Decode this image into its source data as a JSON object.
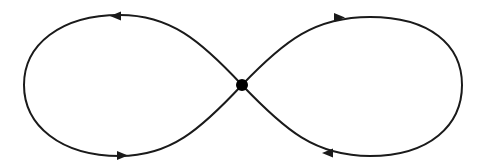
{
  "diagram": {
    "type": "figure-eight-flow",
    "colors": {
      "stroke": "#1a1a1a",
      "node": "#000000",
      "background": "#ffffff"
    },
    "center_node": {
      "x": 242,
      "y": 85,
      "r": 6
    },
    "loops": [
      {
        "name": "left-loop",
        "extreme_x": 24,
        "top_y": 15,
        "bottom_y": 156
      },
      {
        "name": "right-loop",
        "extreme_x": 462,
        "top_y": 17,
        "bottom_y": 156
      }
    ],
    "arrows": [
      {
        "name": "top-left-arrow",
        "x": 118,
        "y": 16,
        "direction": "left"
      },
      {
        "name": "bottom-left-arrow",
        "x": 120,
        "y": 155,
        "direction": "right"
      },
      {
        "name": "top-right-arrow",
        "x": 338,
        "y": 18,
        "direction": "right"
      },
      {
        "name": "bottom-right-arrow",
        "x": 330,
        "y": 153,
        "direction": "left"
      }
    ]
  }
}
